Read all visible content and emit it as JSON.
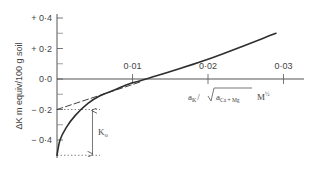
{
  "chart_data": {
    "type": "line",
    "title": "",
    "xlabel": "a_K / √(a_Ca+Mg)  M^½",
    "ylabel": "ΔK m equiv/100 g soil",
    "xlim": [
      0,
      0.031
    ],
    "ylim": [
      -0.5,
      0.45
    ],
    "x_ticks": [
      {
        "value": 0.01,
        "label": "0·01"
      },
      {
        "value": 0.02,
        "label": "0·02"
      },
      {
        "value": 0.03,
        "label": "0·03"
      }
    ],
    "y_ticks": [
      {
        "value": 0.4,
        "label": "+ 0·4"
      },
      {
        "value": 0.2,
        "label": "+ 0·2"
      },
      {
        "value": 0.0,
        "label": "0·0"
      },
      {
        "value": -0.2,
        "label": "− 0·2"
      },
      {
        "value": -0.4,
        "label": "− 0·4"
      }
    ],
    "y_minor_ticks": [
      0.3,
      0.1,
      -0.1,
      -0.3
    ],
    "grid": false,
    "legend": null,
    "series": [
      {
        "name": "Q/I curve",
        "style": "solid",
        "x": [
          0.0,
          0.0004,
          0.0012,
          0.0024,
          0.0041,
          0.0057,
          0.0077,
          0.0097,
          0.0118,
          0.02,
          0.029
        ],
        "y": [
          -0.5,
          -0.4,
          -0.32,
          -0.24,
          -0.16,
          -0.11,
          -0.07,
          -0.03,
          0.0,
          0.13,
          0.3
        ]
      },
      {
        "name": "Linear extrapolation",
        "style": "dashed",
        "x": [
          0.0,
          0.011
        ],
        "y": [
          -0.2,
          -0.02
        ]
      }
    ],
    "annotations": [
      {
        "type": "dotted-hline",
        "y": -0.2,
        "x_range": [
          0,
          0.0057
        ]
      },
      {
        "type": "dotted-hline",
        "y": -0.5,
        "x_range": [
          0,
          0.0057
        ]
      },
      {
        "type": "double-arrow",
        "x": 0.0047,
        "y_range": [
          -0.2,
          -0.5
        ],
        "label": "K",
        "label_sub": "o"
      }
    ]
  },
  "labels": {
    "ylabel": "ΔK m equiv/100 g soil",
    "xlabel_a": "a",
    "xlabel_sub_k": "K",
    "xlabel_slash": "/",
    "xlabel_a2": "a",
    "xlabel_sub_camg": "Ca + Mg",
    "xlabel_unit": "M",
    "xlabel_exp": "½",
    "ko_main": "K",
    "ko_sub": "o"
  }
}
